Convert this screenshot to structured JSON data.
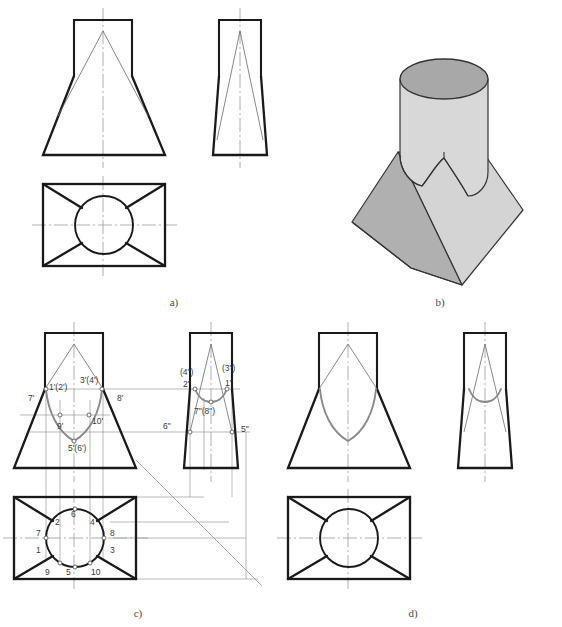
{
  "figure": {
    "background_color": "#ffffff",
    "outline_color": "#1a1a1a",
    "thin_line_color": "#555555",
    "projection_line_color": "#8c8c8c",
    "centerline_color": "#9a9a9a",
    "intersection_curve_color": "#8a8a8a",
    "label_color": "#3a3a3a"
  },
  "panels": [
    {
      "id": "a",
      "caption": "a)",
      "description": "Three orthographic views without intersection curve"
    },
    {
      "id": "b",
      "caption": "b)",
      "description": "Isometric pictorial of the solid"
    },
    {
      "id": "c",
      "caption": "c)",
      "description": "Construction with numbered points and projection lines"
    },
    {
      "id": "d",
      "caption": "d)",
      "description": "Finished views with intersection curve"
    }
  ],
  "shading": {
    "cylinder_top_fill": "#a8a8a8",
    "cylinder_body_fill": "#d8d8d8",
    "pyramid_left_fill": "#b0b0b0",
    "pyramid_right_fill": "#d4d4d4",
    "edge_stroke": "#333333"
  },
  "panel_c": {
    "front_view_labels": [
      {
        "text": "1'(2')",
        "x": 49,
        "y": 390
      },
      {
        "text": "3'(4')",
        "x": 80,
        "y": 383
      },
      {
        "text": "7'",
        "x": 28,
        "y": 399
      },
      {
        "text": "8'",
        "x": 117,
        "y": 399
      },
      {
        "text": "9'",
        "x": 60,
        "y": 428
      },
      {
        "text": "10'",
        "x": 92,
        "y": 423
      },
      {
        "text": "5'(6')",
        "x": 73,
        "y": 444
      }
    ],
    "side_view_labels": [
      {
        "text": "(4\")",
        "x": 185,
        "y": 371
      },
      {
        "text": "(3\")",
        "x": 226,
        "y": 368
      },
      {
        "text": "2\"",
        "x": 187,
        "y": 385
      },
      {
        "text": "1\"",
        "x": 225,
        "y": 384
      },
      {
        "text": "7\"(8\")",
        "x": 199,
        "y": 409
      },
      {
        "text": "6\"",
        "x": 165,
        "y": 424
      },
      {
        "text": "5\"",
        "x": 240,
        "y": 428
      }
    ],
    "top_view_labels": [
      {
        "text": "6",
        "x": 71,
        "y": 513
      },
      {
        "text": "2",
        "x": 57,
        "y": 522
      },
      {
        "text": "4",
        "x": 90,
        "y": 522
      },
      {
        "text": "7",
        "x": 38,
        "y": 533
      },
      {
        "text": "8",
        "x": 113,
        "y": 533
      },
      {
        "text": "1",
        "x": 38,
        "y": 549
      },
      {
        "text": "3",
        "x": 113,
        "y": 549
      },
      {
        "text": "9",
        "x": 47,
        "y": 570
      },
      {
        "text": "5",
        "x": 68,
        "y": 570
      },
      {
        "text": "10",
        "x": 94,
        "y": 570
      }
    ]
  },
  "geometry": {
    "panel_a": {
      "front_cylinder_rect": {
        "x": 74,
        "y": 20,
        "w": 58,
        "h": 56
      },
      "front_pyramid": {
        "apex_x": 103,
        "apex_y": 31,
        "base_left_x": 43,
        "base_right_x": 165,
        "base_y": 155
      },
      "side_cylinder_rect": {
        "x": 219,
        "y": 20,
        "w": 42,
        "h": 56
      },
      "side_pyramid": {
        "apex_x": 240,
        "apex_y": 31,
        "base_left_x": 213,
        "base_right_x": 267,
        "base_y": 155
      },
      "top_rect": {
        "x": 43,
        "y": 184,
        "w": 122,
        "h": 82
      },
      "top_circle": {
        "cx": 104,
        "cy": 225,
        "r": 29
      }
    },
    "panel_c": {
      "front_cylinder_rect": {
        "x": 45,
        "y": 333,
        "w": 58,
        "h": 56
      },
      "front_pyramid": {
        "apex_x": 74,
        "apex_y": 344,
        "base_left_x": 14,
        "base_right_x": 136,
        "base_y": 468
      },
      "side_cylinder_rect": {
        "x": 190,
        "y": 333,
        "w": 42,
        "h": 56
      },
      "side_pyramid": {
        "apex_x": 211,
        "apex_y": 344,
        "base_left_x": 184,
        "base_right_x": 238,
        "base_y": 468
      },
      "top_rect": {
        "x": 14,
        "y": 497,
        "w": 122,
        "h": 82
      },
      "top_circle": {
        "cx": 75,
        "cy": 538,
        "r": 29
      }
    },
    "panel_d": {
      "front_cylinder_rect": {
        "x": 319,
        "y": 333,
        "w": 58,
        "h": 56
      },
      "front_pyramid": {
        "apex_x": 348,
        "apex_y": 344,
        "base_left_x": 288,
        "base_right_x": 410,
        "base_y": 468
      },
      "side_cylinder_rect": {
        "x": 464,
        "y": 333,
        "w": 42,
        "h": 56
      },
      "side_pyramid": {
        "apex_x": 485,
        "apex_y": 344,
        "base_left_x": 458,
        "base_right_x": 512,
        "base_y": 468
      },
      "top_rect": {
        "x": 288,
        "y": 497,
        "w": 122,
        "h": 82
      },
      "top_circle": {
        "cx": 349,
        "cy": 538,
        "r": 29
      }
    }
  },
  "captions": {
    "a": {
      "text": "a)",
      "x": 174,
      "y": 306
    },
    "b": {
      "text": "b)",
      "x": 440,
      "y": 306
    },
    "c": {
      "text": "c)",
      "x": 138,
      "y": 615
    },
    "d": {
      "text": "d)",
      "x": 413,
      "y": 615
    }
  }
}
